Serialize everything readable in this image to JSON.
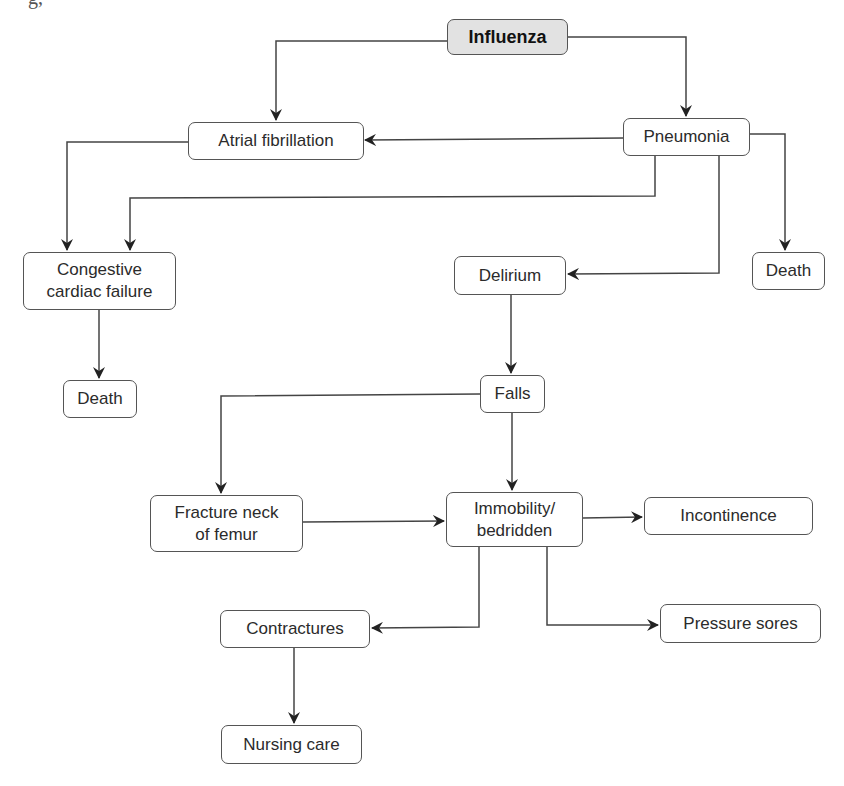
{
  "header": {
    "clipped_text": "g,"
  },
  "nodes": {
    "influenza": {
      "label": "Influenza"
    },
    "atrial_fibrillation": {
      "label": "Atrial fibrillation"
    },
    "pneumonia": {
      "label": "Pneumonia"
    },
    "congestive_cardiac_failure": {
      "label": "Congestive\ncardiac failure"
    },
    "delirium": {
      "label": "Delirium"
    },
    "death_right": {
      "label": "Death"
    },
    "death_left": {
      "label": "Death"
    },
    "falls": {
      "label": "Falls"
    },
    "fracture_neck_of_femur": {
      "label": "Fracture neck\nof femur"
    },
    "immobility_bedridden": {
      "label": "Immobility/\nbedridden"
    },
    "incontinence": {
      "label": "Incontinence"
    },
    "contractures": {
      "label": "Contractures"
    },
    "pressure_sores": {
      "label": "Pressure sores"
    },
    "nursing_care": {
      "label": "Nursing care"
    }
  },
  "edges": [
    {
      "from": "Influenza",
      "to": "Atrial fibrillation"
    },
    {
      "from": "Influenza",
      "to": "Pneumonia"
    },
    {
      "from": "Pneumonia",
      "to": "Atrial fibrillation"
    },
    {
      "from": "Pneumonia",
      "to": "Congestive cardiac failure"
    },
    {
      "from": "Pneumonia",
      "to": "Delirium"
    },
    {
      "from": "Pneumonia",
      "to": "Death"
    },
    {
      "from": "Atrial fibrillation",
      "to": "Congestive cardiac failure"
    },
    {
      "from": "Congestive cardiac failure",
      "to": "Death"
    },
    {
      "from": "Delirium",
      "to": "Falls"
    },
    {
      "from": "Falls",
      "to": "Fracture neck of femur"
    },
    {
      "from": "Falls",
      "to": "Immobility/bedridden"
    },
    {
      "from": "Fracture neck of femur",
      "to": "Immobility/bedridden"
    },
    {
      "from": "Immobility/bedridden",
      "to": "Incontinence"
    },
    {
      "from": "Immobility/bedridden",
      "to": "Contractures"
    },
    {
      "from": "Immobility/bedridden",
      "to": "Pressure sores"
    },
    {
      "from": "Contractures",
      "to": "Nursing care"
    }
  ],
  "colors": {
    "line": "#444444",
    "root_fill": "#e2e2e2",
    "node_border": "#555555"
  }
}
